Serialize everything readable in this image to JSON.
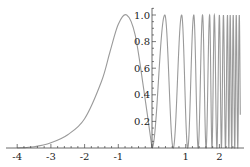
{
  "chart_data": {
    "type": "line",
    "title": "",
    "xlabel": "",
    "ylabel": "",
    "xlim": [
      -4.1,
      2.7
    ],
    "ylim": [
      0,
      1.05
    ],
    "grid": false,
    "legend": null,
    "line_color": "#9a9a9a",
    "axis_color": "#444444",
    "x_ticks": [
      {
        "value": -4,
        "label": "-4"
      },
      {
        "value": -3,
        "label": "-3"
      },
      {
        "value": -2,
        "label": "-2"
      },
      {
        "value": -1,
        "label": "-1"
      },
      {
        "value": 0,
        "label": "0"
      },
      {
        "value": 1,
        "label": "1"
      },
      {
        "value": 2,
        "label": "2"
      }
    ],
    "y_ticks": [
      {
        "value": 0.2,
        "label": "0.2"
      },
      {
        "value": 0.4,
        "label": "0.4"
      },
      {
        "value": 0.6,
        "label": "0.6"
      },
      {
        "value": 0.8,
        "label": "0.8"
      },
      {
        "value": 1.0,
        "label": "1.0"
      }
    ],
    "series": [
      {
        "name": "left-bump",
        "description": "smooth bump rising from ~0 at x=-4, peak 1.0 near x=-0.75, falling to 0 at x=0",
        "x": [
          -4,
          -3.5,
          -3,
          -2.5,
          -2,
          -1.5,
          -1.25,
          -1,
          -0.75,
          -0.5,
          -0.25,
          0
        ],
        "y": [
          0.0,
          0.01,
          0.04,
          0.1,
          0.22,
          0.5,
          0.72,
          0.93,
          1.0,
          0.85,
          0.45,
          0.0
        ]
      },
      {
        "name": "right-oscillation",
        "description": "oscillation between 0 and 1 with increasing frequency for x>0",
        "peaks_x": [
          0.38,
          0.88,
          1.24,
          1.5,
          1.71,
          1.85,
          2.0,
          2.12,
          2.24,
          2.32,
          2.41,
          2.5
        ],
        "peak_y": 1.0,
        "trough_y": 0.0
      }
    ]
  }
}
